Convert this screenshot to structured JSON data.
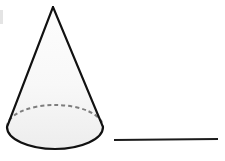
{
  "figure": {
    "title": "",
    "kind": "cone-with-line-segment-diagram",
    "background_color": "#ffffff",
    "shapes": {
      "cone": {
        "name": "cone",
        "apex": {
          "x": 53,
          "y": 7
        },
        "base_ellipse": {
          "center_x": 55,
          "center_y": 127,
          "radius_x": 48,
          "radius_y": 22
        },
        "outline_color": "#111111",
        "outline_width": 2.1,
        "fill_color": "#f4f4f4",
        "fill_top_color": "#fdfdfd",
        "fill_bottom_color": "#ededed",
        "base_fill_color": "#f1f1f1",
        "hidden_edge": {
          "name": "hidden-back-edge-of-base",
          "style": "dashed",
          "color": "#7e7e7e",
          "width": 2,
          "dash_pattern": "4 3"
        },
        "left_slant_end": {
          "x": 7,
          "y": 127
        },
        "right_slant_end": {
          "x": 103,
          "y": 127
        }
      },
      "line_segment": {
        "name": "line-segment",
        "x1": 114,
        "y1": 140,
        "x2": 218,
        "y2": 139,
        "color": "#1b1b1b",
        "width": 2.2,
        "length_px": 104
      },
      "edge_artifact": {
        "name": "scan-edge-artifact",
        "x": 0,
        "y": 10,
        "width": 3,
        "height": 14,
        "color": "#e4e4e4"
      }
    },
    "labels": {
      "cone_label": "",
      "segment_label": ""
    }
  }
}
